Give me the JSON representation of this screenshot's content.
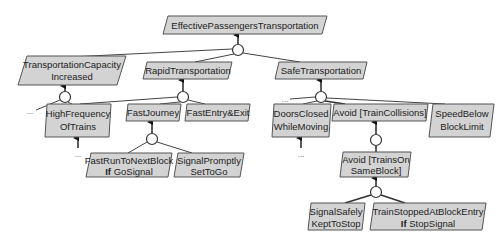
{
  "diagram": {
    "type": "goal-refinement-tree",
    "colors": {
      "goal_fill": "#d3d3d3",
      "goal_stroke": "#555555",
      "edge": "#444444",
      "and_node": "#ffffff"
    },
    "goals": {
      "root": {
        "line1": "EffectivePassengersTransportation"
      },
      "capacity": {
        "line1": "TransportationCapacity",
        "line2": "Increased"
      },
      "rapid": {
        "line1": "RapidTransportation"
      },
      "safe": {
        "line1": "SafeTransportation"
      },
      "highfreq": {
        "line1": "HighFrequency",
        "line2": "OfTrains"
      },
      "fastjourney": {
        "line1": "FastJourney"
      },
      "fastentry": {
        "line1": "FastEntry&Exit"
      },
      "doors": {
        "line1": "DoorsClosed",
        "line2": "WhileMoving"
      },
      "avoidcoll": {
        "line1": "Avoid [TrainCollisions]"
      },
      "speed": {
        "line1": "SpeedBelow",
        "line2": "BlockLimit"
      },
      "fastrun": {
        "line1": "FastRunToNextBlock",
        "kw": "If",
        "line2": " GoSignal"
      },
      "signalprompt": {
        "line1": "SignalPromptly",
        "line2": "SetToGo"
      },
      "avoidsame": {
        "line1": "Avoid [TrainsOn",
        "line2": "SameBlock]"
      },
      "signalsafe": {
        "line1": "SignalSafely",
        "line2": "KeptToStop"
      },
      "trainstopped": {
        "line1": "TrainStoppedAtBlockEntry",
        "kw": "If",
        "line2": " StopSignal"
      }
    },
    "ellipsis": "..."
  }
}
